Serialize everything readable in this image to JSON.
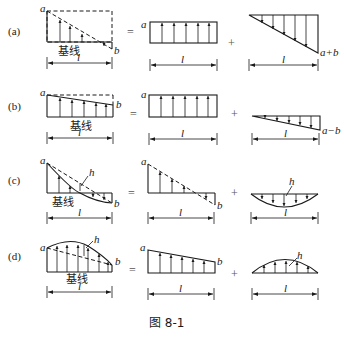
{
  "figure": {
    "caption": "图 8-1",
    "baseline_label": "基线",
    "length_label": "l",
    "equals": "=",
    "plus": "+",
    "rows": [
      {
        "id": "a",
        "row_label": "(a)",
        "left": {
          "start_label": "a",
          "end_label": "b",
          "has_baseline_label": true
        },
        "middle": {
          "start_label": "a"
        },
        "right": {
          "end_label": "a+b"
        }
      },
      {
        "id": "b",
        "row_label": "(b)",
        "left": {
          "start_label": "a",
          "end_label": "b",
          "has_baseline_label": true
        },
        "middle": {
          "start_label": "a"
        },
        "right": {
          "end_label": "a−b"
        }
      },
      {
        "id": "c",
        "row_label": "(c)",
        "left": {
          "start_label": "a",
          "end_label": "b",
          "mid_label": "h",
          "has_baseline_label": true
        },
        "middle": {
          "start_label": "a",
          "end_label": "b"
        },
        "right": {
          "mid_label": "h"
        }
      },
      {
        "id": "d",
        "row_label": "(d)",
        "left": {
          "start_label": "a",
          "end_label": "b",
          "mid_label": "h",
          "has_baseline_label": true
        },
        "middle": {
          "start_label": "a",
          "end_label": "b"
        },
        "right": {
          "mid_label": "h"
        }
      }
    ]
  },
  "colors": {
    "ink": "#1a1a1a",
    "background": "#ffffff"
  }
}
